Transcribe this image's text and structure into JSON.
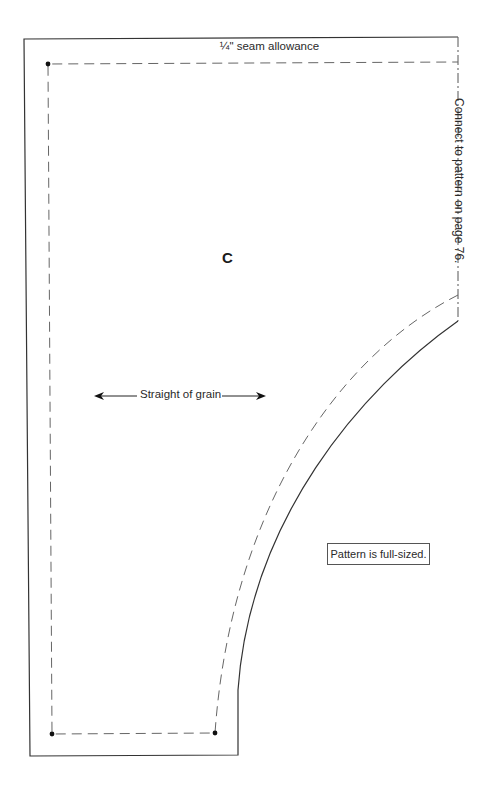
{
  "diagram": {
    "type": "sewing-pattern-piece",
    "piece_label": "C",
    "seam_allowance_label": "¼\" seam allowance",
    "grain_label": "Straight of grain",
    "full_size_note": "Pattern is full-sized.",
    "connect_note": "Connect to pattern on page 76.",
    "colors": {
      "background": "#ffffff",
      "cut_line": "#333333",
      "seam_line": "#666666",
      "text": "#2a2a2a"
    },
    "markers": [
      {
        "name": "corner-dot-top-left",
        "x": 48,
        "y": 64
      },
      {
        "name": "corner-dot-bottom-left",
        "x": 52,
        "y": 734
      },
      {
        "name": "corner-dot-bottom-right",
        "x": 215,
        "y": 733
      }
    ]
  }
}
